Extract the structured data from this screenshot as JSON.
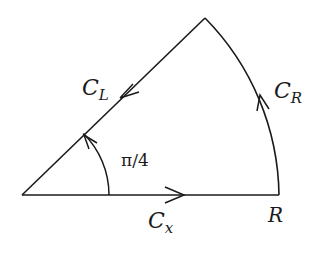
{
  "diagram": {
    "type": "contour-sector",
    "stroke_color": "#1a1a1a",
    "background": "#ffffff",
    "geometry": {
      "origin": [
        22,
        195
      ],
      "right_corner": [
        279,
        195
      ],
      "apex": [
        205,
        18
      ],
      "radius_px": 257,
      "angle_arc_radius_px": 87
    },
    "labels": {
      "c_left_main": "C",
      "c_left_sub": "L",
      "c_right_main": "C",
      "c_right_sub": "R",
      "c_x_main": "C",
      "c_x_sub": "x",
      "radius": "R",
      "angle": "π/4"
    },
    "segments": [
      {
        "name": "C_x",
        "direction": "origin to R along real axis"
      },
      {
        "name": "C_R",
        "direction": "counterclockwise along arc of radius R"
      },
      {
        "name": "C_L",
        "direction": "from apex back to origin along ray at angle π/4"
      }
    ]
  }
}
